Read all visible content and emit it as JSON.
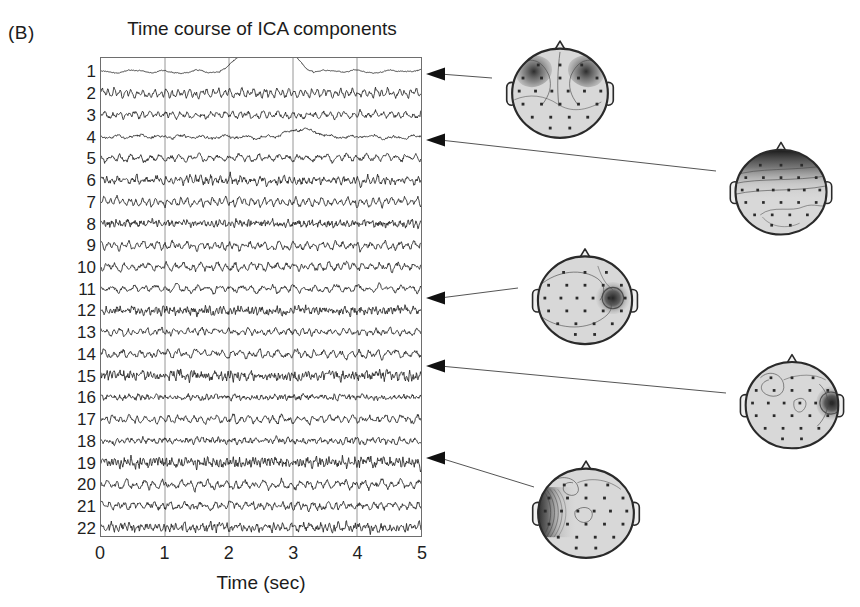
{
  "panel": {
    "label": "(B)",
    "title": "Time course of ICA components"
  },
  "axes": {
    "xlabel": "Time (sec)",
    "xticks": [
      "0",
      "1",
      "2",
      "3",
      "4",
      "5"
    ],
    "xlim": [
      0,
      5
    ],
    "grid": "vertical gridlines at 1, 2, 3 and 4 sec",
    "component_labels": [
      "1",
      "2",
      "3",
      "4",
      "5",
      "6",
      "7",
      "8",
      "9",
      "10",
      "11",
      "12",
      "13",
      "14",
      "15",
      "16",
      "17",
      "18",
      "19",
      "20",
      "21",
      "22"
    ]
  },
  "chart_data": {
    "type": "line",
    "title": "Time course of ICA components",
    "xlabel": "Time (sec)",
    "ylabel": "",
    "xlim": [
      0,
      5
    ],
    "grid": true,
    "legend": "none",
    "n_components": 22,
    "series": [
      {
        "name": "1",
        "label": "1",
        "kind": "slow-drift",
        "amp": 0.3,
        "noise": 0.07,
        "freq": 2.0,
        "seed": 11,
        "event": {
          "type": "blink",
          "start": 2.05,
          "end": 3.12,
          "height": 2.9
        }
      },
      {
        "name": "2",
        "label": "2",
        "kind": "rhythmic",
        "amp": 0.78,
        "noise": 0.22,
        "freq": 11.0,
        "seed": 22
      },
      {
        "name": "3",
        "label": "3",
        "kind": "rhythmic",
        "amp": 0.52,
        "noise": 0.25,
        "freq": 8.5,
        "seed": 33
      },
      {
        "name": "4",
        "label": "4",
        "kind": "slow-drift",
        "amp": 0.3,
        "noise": 0.16,
        "freq": 3.0,
        "seed": 44,
        "event": {
          "type": "bump",
          "start": 2.7,
          "end": 3.55,
          "height": 1.25
        }
      },
      {
        "name": "5",
        "label": "5",
        "kind": "rhythmic",
        "amp": 0.62,
        "noise": 0.24,
        "freq": 6.5,
        "seed": 55
      },
      {
        "name": "6",
        "label": "6",
        "kind": "noisy",
        "amp": 0.58,
        "noise": 0.34,
        "freq": 13.0,
        "seed": 66
      },
      {
        "name": "7",
        "label": "7",
        "kind": "rhythmic",
        "amp": 0.74,
        "noise": 0.24,
        "freq": 10.0,
        "seed": 77
      },
      {
        "name": "8",
        "label": "8",
        "kind": "noisy",
        "amp": 0.4,
        "noise": 0.38,
        "freq": 16.0,
        "seed": 88
      },
      {
        "name": "9",
        "label": "9",
        "kind": "rhythmic",
        "amp": 0.7,
        "noise": 0.26,
        "freq": 9.0,
        "seed": 99
      },
      {
        "name": "10",
        "label": "10",
        "kind": "rhythmic",
        "amp": 0.66,
        "noise": 0.28,
        "freq": 7.5,
        "seed": 101
      },
      {
        "name": "11",
        "label": "11",
        "kind": "rhythmic",
        "amp": 0.6,
        "noise": 0.24,
        "freq": 6.0,
        "seed": 111
      },
      {
        "name": "12",
        "label": "12",
        "kind": "noisy",
        "amp": 0.48,
        "noise": 0.42,
        "freq": 18.0,
        "seed": 121
      },
      {
        "name": "13",
        "label": "13",
        "kind": "rhythmic",
        "amp": 0.5,
        "noise": 0.24,
        "freq": 9.5,
        "seed": 131
      },
      {
        "name": "14",
        "label": "14",
        "kind": "rhythmic",
        "amp": 0.7,
        "noise": 0.28,
        "freq": 7.0,
        "seed": 141
      },
      {
        "name": "15",
        "label": "15",
        "kind": "noisy",
        "amp": 0.52,
        "noise": 0.46,
        "freq": 19.0,
        "seed": 151
      },
      {
        "name": "16",
        "label": "16",
        "kind": "noisy",
        "amp": 0.34,
        "noise": 0.26,
        "freq": 14.0,
        "seed": 161
      },
      {
        "name": "17",
        "label": "17",
        "kind": "rhythmic",
        "amp": 0.66,
        "noise": 0.26,
        "freq": 8.0,
        "seed": 171
      },
      {
        "name": "18",
        "label": "18",
        "kind": "noisy",
        "amp": 0.4,
        "noise": 0.28,
        "freq": 12.0,
        "seed": 181
      },
      {
        "name": "19",
        "label": "19",
        "kind": "noisy",
        "amp": 0.6,
        "noise": 0.48,
        "freq": 20.0,
        "seed": 191
      },
      {
        "name": "20",
        "label": "20",
        "kind": "rhythmic",
        "amp": 0.72,
        "noise": 0.3,
        "freq": 7.0,
        "seed": 201
      },
      {
        "name": "21",
        "label": "21",
        "kind": "rhythmic",
        "amp": 0.64,
        "noise": 0.3,
        "freq": 8.5,
        "seed": 211
      },
      {
        "name": "22",
        "label": "22",
        "kind": "noisy",
        "amp": 0.52,
        "noise": 0.4,
        "freq": 15.0,
        "seed": 221
      }
    ]
  },
  "scalp_maps": [
    {
      "id": "map-frontal-bilateral",
      "name": "frontal-bilateral-scalp-map",
      "component": "1",
      "pattern": "bilateral-frontal",
      "x": 494,
      "y": 28,
      "w": 132,
      "h": 124
    },
    {
      "id": "map-frontal-midline",
      "name": "frontal-midline-scalp-map",
      "component": "4",
      "pattern": "frontal-band",
      "x": 718,
      "y": 130,
      "w": 126,
      "h": 118
    },
    {
      "id": "map-right-temporal-focal",
      "name": "right-temporal-focal-scalp-map",
      "component": "12",
      "pattern": "right-focal",
      "x": 520,
      "y": 236,
      "w": 130,
      "h": 122
    },
    {
      "id": "map-right-edge-temporal",
      "name": "right-edge-temporal-scalp-map",
      "component": "15",
      "pattern": "right-edge-focal",
      "x": 728,
      "y": 342,
      "w": 128,
      "h": 120
    },
    {
      "id": "map-left-lateral",
      "name": "left-lateral-scalp-map",
      "component": "19",
      "pattern": "left-lateral",
      "x": 520,
      "y": 448,
      "w": 132,
      "h": 124
    }
  ],
  "arrows": [
    {
      "name": "arrow-to-component-1",
      "component": "1",
      "tip_x": 426,
      "tip_y": 74,
      "tail_x": 492,
      "tail_y": 78,
      "map": "map-frontal-bilateral"
    },
    {
      "name": "arrow-to-component-4",
      "component": "4",
      "tip_x": 426,
      "tip_y": 140,
      "tail_x": 716,
      "tail_y": 171,
      "map": "map-frontal-midline"
    },
    {
      "name": "arrow-to-component-12",
      "component": "12",
      "tip_x": 426,
      "tip_y": 298,
      "tail_x": 518,
      "tail_y": 288,
      "map": "map-right-temporal-focal"
    },
    {
      "name": "arrow-to-component-15",
      "component": "15",
      "tip_x": 426,
      "tip_y": 366,
      "tail_x": 726,
      "tail_y": 393,
      "map": "map-right-edge-temporal"
    },
    {
      "name": "arrow-to-component-19",
      "component": "19",
      "tip_x": 426,
      "tip_y": 458,
      "tail_x": 534,
      "tail_y": 487,
      "map": "map-left-lateral"
    }
  ],
  "colors": {
    "ink": "#1c1c1c",
    "trace": "#232323",
    "frame": "#6e6e6e",
    "grid": "#8a8a8a",
    "scalp_fill": "#d8d8d8",
    "scalp_outline": "#2a2a2a",
    "hot": "#3a3a3a",
    "electrode": "#2b2b2b"
  }
}
